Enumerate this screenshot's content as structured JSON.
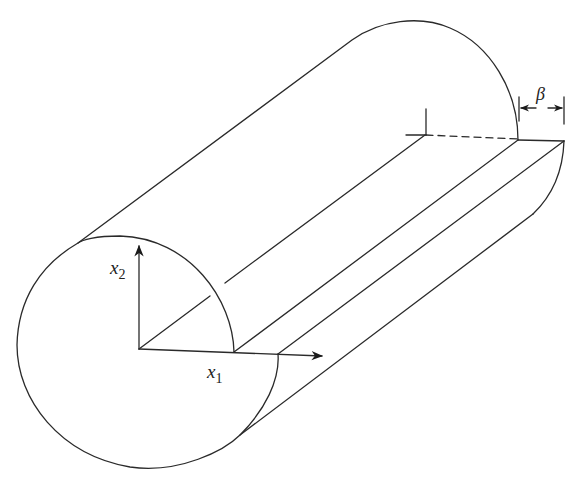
{
  "figure": {
    "labels": {
      "x1": {
        "base": "x",
        "sub": "1"
      },
      "x2": {
        "base": "x",
        "sub": "2"
      },
      "beta": "β"
    },
    "colors": {
      "stroke": "#2a2a2a",
      "background": "#ffffff"
    }
  }
}
